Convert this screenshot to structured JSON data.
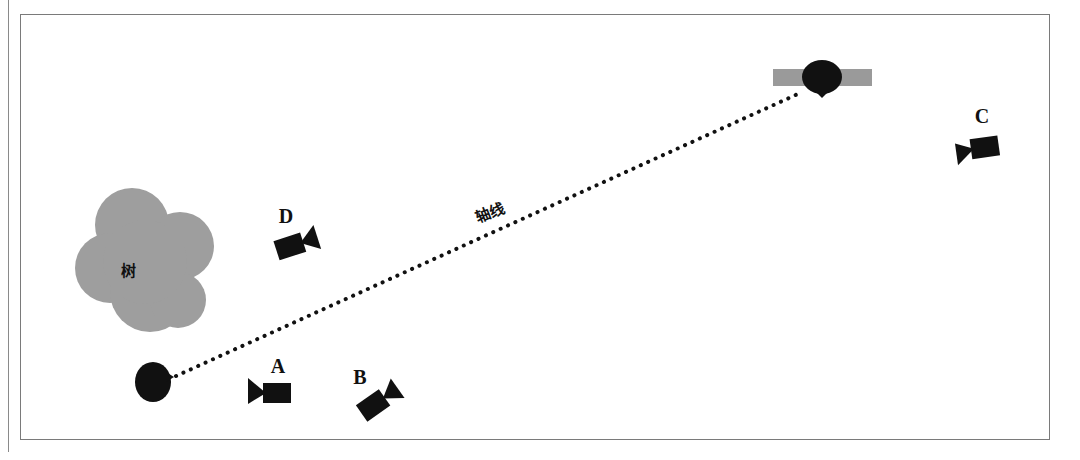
{
  "diagram": {
    "type": "camera-axis-blocking",
    "axis_label": "轴线",
    "tree_label": "树",
    "colors": {
      "figure": "#111111",
      "tree": "#9e9e9e",
      "platform": "#9a9a9a",
      "axis_dots": "#111111",
      "frame": "#7a7a7a"
    },
    "subjects": [
      {
        "id": "subject-left",
        "desc": "person seen from above, lower-left"
      },
      {
        "id": "subject-right",
        "desc": "person at bar/table, upper-right"
      }
    ],
    "cameras": [
      {
        "label": "A"
      },
      {
        "label": "B"
      },
      {
        "label": "C"
      },
      {
        "label": "D"
      }
    ]
  }
}
